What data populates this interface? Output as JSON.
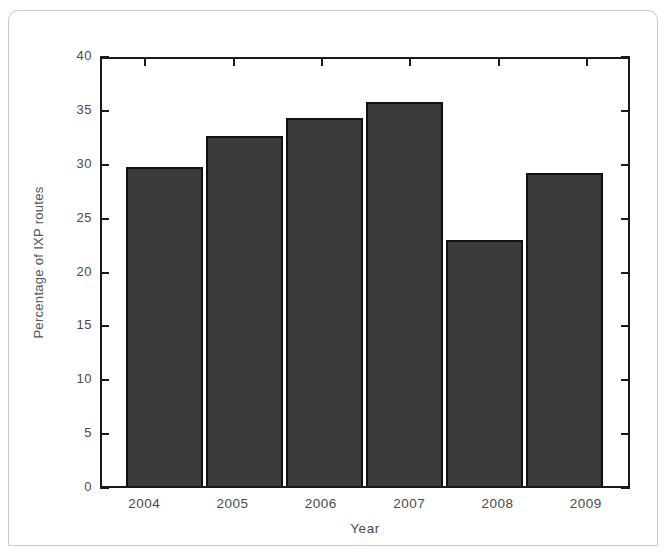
{
  "figure": {
    "background_color": "#ffffff",
    "frame_color": "#c9c9c9",
    "axis_color": "#1a1a1a",
    "bar_fill_color": "#3b3b3b",
    "bar_edge_color": "#111111",
    "tick_text_color": "#4a4a4a"
  },
  "chart_data": {
    "type": "bar",
    "title": "",
    "xlabel": "Year",
    "ylabel": "Percentage of IXP routes",
    "categories": [
      "2004",
      "2005",
      "2006",
      "2007",
      "2008",
      "2009"
    ],
    "values": [
      29.9,
      32.8,
      34.5,
      36.0,
      23.0,
      29.3
    ],
    "ylim": [
      0,
      40
    ],
    "yticks": [
      0,
      5,
      10,
      15,
      20,
      25,
      30,
      35,
      40
    ],
    "ytick_labels": [
      "0",
      "5",
      "10",
      "15",
      "20",
      "25",
      "30",
      "35",
      "40"
    ],
    "xtick_labels": [
      "2004",
      "2005",
      "2006",
      "2007",
      "2008",
      "2009"
    ],
    "grid": false,
    "legend": null,
    "series": [
      {
        "name": "Percentage of IXP routes",
        "values": [
          29.9,
          32.8,
          34.5,
          36.0,
          23.0,
          29.3
        ]
      }
    ]
  }
}
